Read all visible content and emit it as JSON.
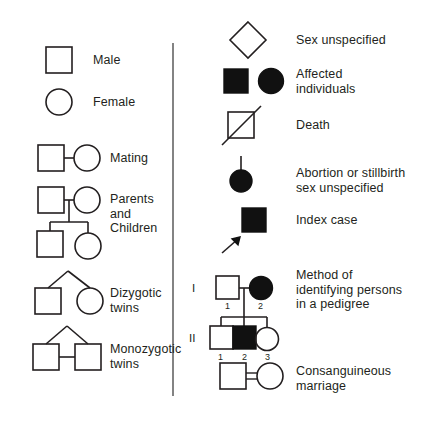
{
  "figure": {
    "background_color": "#ffffff",
    "line_color": "#231f20",
    "fill_color": "#111111",
    "divider_color": "#5a5a5a"
  },
  "divider": {
    "name": "vertical-divider",
    "x": 173,
    "y_top": 43,
    "y_bottom": 396
  },
  "left_column": [
    {
      "key": "male",
      "label": "Male",
      "symbol": "square-open"
    },
    {
      "key": "female",
      "label": "Female",
      "symbol": "circle-open"
    },
    {
      "key": "mating",
      "label": "Mating",
      "symbol": "square-line-circle"
    },
    {
      "key": "parents_children",
      "label": "Parents\nand\nChildren",
      "symbol": "pedigree-nuclear-family"
    },
    {
      "key": "dizygotic",
      "label": "Dizygotic\ntwins",
      "symbol": "twin-fork-square-circle"
    },
    {
      "key": "monozygotic",
      "label": "Monozygotic\ntwins",
      "symbol": "twin-fork-squares-bar"
    }
  ],
  "right_column": [
    {
      "key": "sex_unspecified",
      "label": "Sex unspecified",
      "symbol": "diamond-open"
    },
    {
      "key": "affected",
      "label": "Affected\nindividuals",
      "symbol": "square-filled-and-circle-filled"
    },
    {
      "key": "death",
      "label": "Death",
      "symbol": "square-with-diagonal-slash"
    },
    {
      "key": "abortion",
      "label": "Abortion or stillbirth\nsex unspecified",
      "symbol": "small-filled-circle-with-stem"
    },
    {
      "key": "index_case",
      "label": "Index case",
      "symbol": "filled-square-with-arrow"
    },
    {
      "key": "method",
      "label": "Method of\nidentifying persons\nin a pedigree",
      "symbol": "numbered-pedigree"
    },
    {
      "key": "consanguineous",
      "label": "Consanguineous\nmarriage",
      "symbol": "square-double-line-circle"
    }
  ],
  "pedigree_example": {
    "generations": [
      "I",
      "II"
    ],
    "generation_I": [
      {
        "id": "1",
        "symbol": "square-open"
      },
      {
        "id": "2",
        "symbol": "circle-filled"
      }
    ],
    "generation_II": [
      {
        "id": "1",
        "symbol": "square-open"
      },
      {
        "id": "2",
        "symbol": "square-filled"
      },
      {
        "id": "3",
        "symbol": "circle-open"
      }
    ]
  }
}
